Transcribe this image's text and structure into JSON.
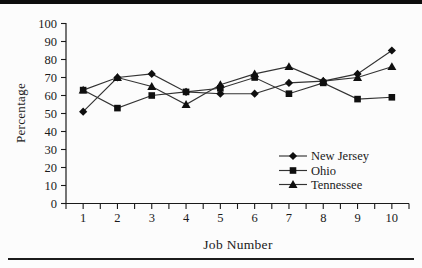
{
  "figure": {
    "background": "#fcfcfc",
    "top_rule_color": "#0d0d0d",
    "bottom_rule_color": "#1c1c1c"
  },
  "chart_data": {
    "type": "line",
    "title": "",
    "xlabel": "Job Number",
    "ylabel": "Percentage",
    "x": [
      1,
      2,
      3,
      4,
      5,
      6,
      7,
      8,
      9,
      10
    ],
    "xtick_labels": [
      "1",
      "2",
      "3",
      "4",
      "5",
      "6",
      "7",
      "8",
      "9",
      "10"
    ],
    "ylim": [
      0,
      100
    ],
    "ytick_step": 10,
    "ytick_labels": [
      "0",
      "10",
      "20",
      "30",
      "40",
      "50",
      "60",
      "70",
      "80",
      "90",
      "100"
    ],
    "grid": false,
    "legend_position": "inside-right",
    "line_color": "#333333",
    "marker_color": "#0f0f0f",
    "axis_color": "#1a1a1a",
    "series": [
      {
        "name": "New Jersey",
        "marker": "diamond",
        "values": [
          51,
          70,
          72,
          62,
          61,
          61,
          67,
          68,
          72,
          85
        ]
      },
      {
        "name": "Ohio",
        "marker": "square",
        "values": [
          63,
          53,
          60,
          62,
          64,
          70,
          61,
          67,
          58,
          59
        ]
      },
      {
        "name": "Tennessee",
        "marker": "triangle",
        "values": [
          63,
          70,
          65,
          55,
          66,
          72,
          76,
          68,
          70,
          76
        ]
      }
    ],
    "draw_order": [
      0,
      2,
      1
    ]
  }
}
